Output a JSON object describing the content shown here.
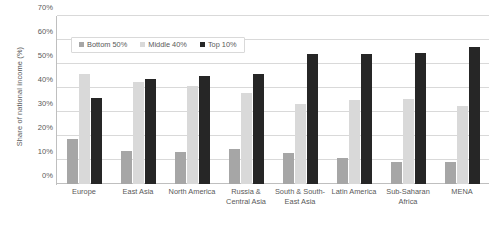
{
  "chart_data": {
    "type": "bar",
    "title": "",
    "xlabel": "",
    "ylabel": "Share of national income (%)",
    "ylim": [
      0,
      70
    ],
    "ytick_labels": [
      "70%",
      "60%",
      "50%",
      "40%",
      "30%",
      "20%",
      "10%",
      "0%"
    ],
    "ytick_values": [
      70,
      60,
      50,
      40,
      30,
      20,
      10,
      0
    ],
    "grid": true,
    "legend_position": "top-left-inside",
    "categories": [
      "Europe",
      "East Asia",
      "North America",
      "Russia & Central Asia",
      "South & South-East Asia",
      "Latin America",
      "Sub-Saharan Africa",
      "MENA"
    ],
    "series": [
      {
        "name": "Bottom 50%",
        "color": "#a6a6a6",
        "values": [
          18.8,
          13.8,
          13.3,
          14.6,
          12.8,
          11.0,
          9.0,
          9.0
        ]
      },
      {
        "name": "Middle 40%",
        "color": "#d9d9d9",
        "values": [
          45.8,
          42.5,
          41.0,
          38.0,
          33.2,
          35.0,
          35.4,
          32.5
        ]
      },
      {
        "name": "Top 10%",
        "color": "#262626",
        "values": [
          35.8,
          43.8,
          45.0,
          46.0,
          54.0,
          54.2,
          54.5,
          57.0
        ]
      }
    ]
  },
  "axis": {
    "y_title": "Share of national income (%)"
  },
  "legend": {
    "items": [
      {
        "label": "Bottom 50%",
        "color": "#a6a6a6"
      },
      {
        "label": "Middle 40%",
        "color": "#d9d9d9"
      },
      {
        "label": "Top 10%",
        "color": "#262626"
      }
    ]
  }
}
